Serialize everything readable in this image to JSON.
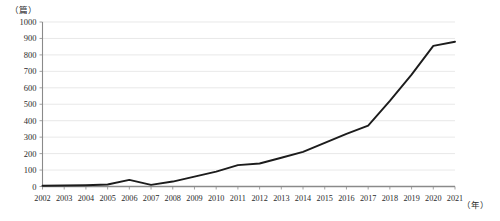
{
  "chart_data": {
    "type": "line",
    "title": "",
    "xlabel": "（年）",
    "ylabel": "（篇）",
    "x": [
      2002,
      2003,
      2004,
      2005,
      2006,
      2007,
      2008,
      2009,
      2010,
      2011,
      2012,
      2013,
      2014,
      2015,
      2016,
      2017,
      2018,
      2019,
      2020,
      2021
    ],
    "categories": [
      "2002",
      "2003",
      "2004",
      "2005",
      "2006",
      "2007",
      "2008",
      "2009",
      "2010",
      "2011",
      "2012",
      "2013",
      "2014",
      "2015",
      "2016",
      "2017",
      "2018",
      "2019",
      "2020",
      "2021"
    ],
    "series": [
      {
        "name": "发文量",
        "values": [
          5,
          6,
          8,
          12,
          40,
          10,
          30,
          60,
          90,
          130,
          140,
          175,
          210,
          265,
          320,
          370,
          520,
          680,
          855,
          880
        ]
      }
    ],
    "values": [
      5,
      6,
      8,
      12,
      40,
      10,
      30,
      60,
      90,
      130,
      140,
      175,
      210,
      265,
      320,
      370,
      520,
      680,
      855,
      880
    ],
    "ylim": [
      0,
      1000
    ],
    "yticks": [
      0,
      100,
      200,
      300,
      400,
      500,
      600,
      700,
      800,
      900,
      1000
    ],
    "ytick_labels": [
      "0",
      "100",
      "200",
      "300",
      "400",
      "500",
      "600",
      "700",
      "800",
      "900",
      "1000"
    ],
    "xlim": [
      2002,
      2021
    ],
    "grid": true,
    "grid_axis": "y",
    "legend": false,
    "legend_position": "none",
    "line_color": "#1c1c1c",
    "grid_color": "#d9d9d9",
    "axis_color": "#8a8a8a"
  },
  "axes": {
    "y_unit_label": "（篇）",
    "x_unit_label": "（年）"
  }
}
